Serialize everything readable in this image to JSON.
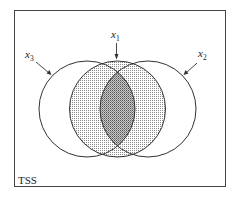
{
  "diagram": {
    "type": "venn",
    "frame_label": "TSS",
    "colors": {
      "stroke": "#333333",
      "background": "#ffffff",
      "light_shade_dot": "#8a8a8a",
      "dark_shade_dot": "#555555"
    },
    "sets": [
      {
        "id": "x1",
        "label": "x",
        "subscript": "1",
        "position": "center",
        "shaded": true
      },
      {
        "id": "x2",
        "label": "x",
        "subscript": "2",
        "position": "right",
        "shaded": false
      },
      {
        "id": "x3",
        "label": "x",
        "subscript": "3",
        "position": "left",
        "shaded": false
      }
    ],
    "regions": [
      {
        "name": "x1 only / partial overlaps",
        "shading": "light dotted"
      },
      {
        "name": "x1 ∩ x2 ∩ x3",
        "shading": "dark dotted"
      }
    ]
  }
}
